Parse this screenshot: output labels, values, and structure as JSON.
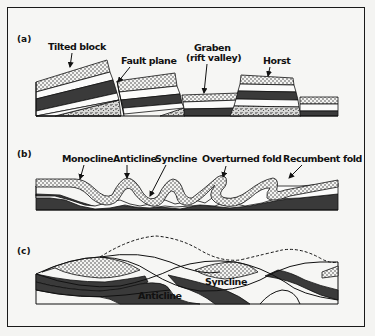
{
  "figure": {
    "panels": [
      {
        "id": "a",
        "label": "(a)",
        "title": "Fault structures",
        "annotations": [
          {
            "key": "tilted_block",
            "text": "Tilted block"
          },
          {
            "key": "fault_plane",
            "text": "Fault plane"
          },
          {
            "key": "graben",
            "text": "Graben",
            "text2": "(rift valley)"
          },
          {
            "key": "horst",
            "text": "Horst"
          }
        ]
      },
      {
        "id": "b",
        "label": "(b)",
        "title": "Fold structures",
        "annotations": [
          {
            "key": "monocline",
            "text": "Monocline"
          },
          {
            "key": "anticline",
            "text": "Anticline"
          },
          {
            "key": "syncline",
            "text": "Syncline"
          },
          {
            "key": "overturned_fold",
            "text": "Overturned fold"
          },
          {
            "key": "recumbent_fold",
            "text": "Recumbent fold"
          }
        ]
      },
      {
        "id": "c",
        "label": "(c)",
        "title": "Eroded folds",
        "annotations": [
          {
            "key": "anticline",
            "text": "Anticline"
          },
          {
            "key": "syncline",
            "text": "Syncline"
          }
        ]
      }
    ],
    "colors": {
      "ink": "#111111",
      "dark_layer": "#3a3a3a",
      "paper": "#f6f6f4"
    }
  }
}
